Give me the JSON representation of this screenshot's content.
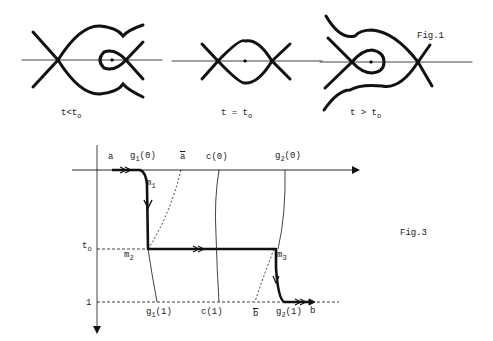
{
  "fig1": {
    "caption": "Fig.1",
    "panels": [
      {
        "label_t": "t",
        "label_rel": "<",
        "label_t0": "t",
        "label_t0_sub": "o"
      },
      {
        "label_t": "t",
        "label_rel": " = ",
        "label_t0": "t",
        "label_t0_sub": "o"
      },
      {
        "label_t": "t",
        "label_rel": " > ",
        "label_t0": "t",
        "label_t0_sub": "o"
      }
    ]
  },
  "fig3": {
    "caption": "Fig.3",
    "top_labels": {
      "a": "a",
      "g1_0": "g",
      "g1_0_sub": "1",
      "g1_0_arg": "(0)",
      "a_tilde": "a",
      "c_0": "c(0)",
      "g2_0": "g",
      "g2_0_sub": "2",
      "g2_0_arg": "(0)"
    },
    "axis_labels": {
      "t0": "t",
      "t0_sub": "o",
      "one": "1"
    },
    "points": {
      "m1": "m",
      "m1_sub": "1",
      "m2": "m",
      "m2_sub": "2",
      "m3": "m",
      "m3_sub": "3"
    },
    "bottom_labels": {
      "g1_1": "g",
      "g1_1_sub": "1",
      "g1_1_arg": "(1)",
      "c_1": "c(1)",
      "b_tilde": "b",
      "g2_1": "g",
      "g2_1_sub": "2",
      "g2_1_arg": "(1)",
      "b": "b"
    }
  }
}
